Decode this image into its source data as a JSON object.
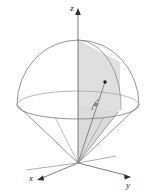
{
  "figure": {
    "kind": "3d-spherical-coordinates-diagram",
    "background_color": "#ffffff",
    "stroke_color": "#7a7a7a",
    "axis_color": "#6e6e6e",
    "shade_fill": "#d9d9d9",
    "shade_stroke": "#9a9a9a",
    "marker_color": "#1a1a1a",
    "label_color": "#1a1a1a",
    "width": 148,
    "height": 192
  },
  "axes": {
    "z": {
      "label": "z",
      "label_x": 72,
      "label_y": 11,
      "arrow_name": "z-axis-arrowhead"
    },
    "x": {
      "label": "x",
      "label_x": 31,
      "label_y": 181,
      "arrow_name": "x-axis-arrowhead"
    },
    "y": {
      "label": "y",
      "label_x": 128,
      "label_y": 188,
      "arrow_name": "y-axis-arrowhead"
    },
    "origin": {
      "x": 78,
      "y": 163
    }
  },
  "geometry": {
    "dome": {
      "center_x": 78,
      "center_y": 105,
      "radius_x": 61,
      "radius_y": 65
    },
    "equator": {
      "center_x": 78,
      "center_y": 105,
      "radius_x": 61,
      "radius_y": 14
    },
    "cone": {
      "apex_x": 78,
      "apex_y": 163,
      "rim_center_y": 105,
      "rim_radius_x": 61,
      "rim_radius_y": 14
    }
  },
  "annotations": {
    "point_marker": {
      "name": "surface-point-marker",
      "x": 105,
      "y": 82
    },
    "angle": {
      "label": "φ",
      "label_x": 96,
      "label_y": 106,
      "arc_name": "angle-arc"
    }
  }
}
